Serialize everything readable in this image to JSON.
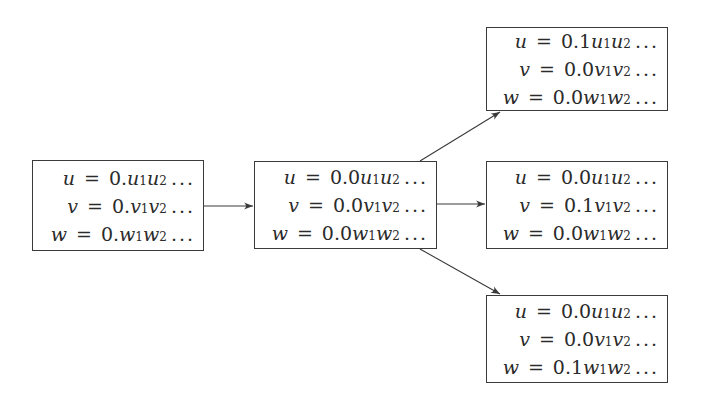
{
  "diagram": {
    "type": "flow-tree",
    "nodes": [
      {
        "id": "root",
        "lines": [
          {
            "lhs": "u",
            "op": "=",
            "prefix": "0.",
            "d1": "u",
            "d2": "u",
            "sub1": "1",
            "sub2": "2",
            "dots": "..."
          },
          {
            "lhs": "v",
            "op": "=",
            "prefix": "0.",
            "d1": "v",
            "d2": "v",
            "sub1": "1",
            "sub2": "2",
            "dots": "..."
          },
          {
            "lhs": "w",
            "op": "=",
            "prefix": "0.",
            "d1": "w",
            "d2": "w",
            "sub1": "1",
            "sub2": "2",
            "dots": "..."
          }
        ]
      },
      {
        "id": "middle",
        "lines": [
          {
            "lhs": "u",
            "op": "=",
            "prefix": "0.0",
            "d1": "u",
            "d2": "u",
            "sub1": "1",
            "sub2": "2",
            "dots": "..."
          },
          {
            "lhs": "v",
            "op": "=",
            "prefix": "0.0",
            "d1": "v",
            "d2": "v",
            "sub1": "1",
            "sub2": "2",
            "dots": "..."
          },
          {
            "lhs": "w",
            "op": "=",
            "prefix": "0.0",
            "d1": "w",
            "d2": "w",
            "sub1": "1",
            "sub2": "2",
            "dots": "..."
          }
        ]
      },
      {
        "id": "child-u",
        "lines": [
          {
            "lhs": "u",
            "op": "=",
            "prefix": "0.1",
            "d1": "u",
            "d2": "u",
            "sub1": "1",
            "sub2": "2",
            "dots": "..."
          },
          {
            "lhs": "v",
            "op": "=",
            "prefix": "0.0",
            "d1": "v",
            "d2": "v",
            "sub1": "1",
            "sub2": "2",
            "dots": "..."
          },
          {
            "lhs": "w",
            "op": "=",
            "prefix": "0.0",
            "d1": "w",
            "d2": "w",
            "sub1": "1",
            "sub2": "2",
            "dots": "..."
          }
        ]
      },
      {
        "id": "child-v",
        "lines": [
          {
            "lhs": "u",
            "op": "=",
            "prefix": "0.0",
            "d1": "u",
            "d2": "u",
            "sub1": "1",
            "sub2": "2",
            "dots": "..."
          },
          {
            "lhs": "v",
            "op": "=",
            "prefix": "0.1",
            "d1": "v",
            "d2": "v",
            "sub1": "1",
            "sub2": "2",
            "dots": "..."
          },
          {
            "lhs": "w",
            "op": "=",
            "prefix": "0.0",
            "d1": "w",
            "d2": "w",
            "sub1": "1",
            "sub2": "2",
            "dots": "..."
          }
        ]
      },
      {
        "id": "child-w",
        "lines": [
          {
            "lhs": "u",
            "op": "=",
            "prefix": "0.0",
            "d1": "u",
            "d2": "u",
            "sub1": "1",
            "sub2": "2",
            "dots": "..."
          },
          {
            "lhs": "v",
            "op": "=",
            "prefix": "0.0",
            "d1": "v",
            "d2": "v",
            "sub1": "1",
            "sub2": "2",
            "dots": "..."
          },
          {
            "lhs": "w",
            "op": "=",
            "prefix": "0.1",
            "d1": "w",
            "d2": "w",
            "sub1": "1",
            "sub2": "2",
            "dots": "..."
          }
        ]
      }
    ],
    "edges": [
      {
        "from": "root",
        "to": "middle"
      },
      {
        "from": "middle",
        "to": "child-u"
      },
      {
        "from": "middle",
        "to": "child-v"
      },
      {
        "from": "middle",
        "to": "child-w"
      }
    ],
    "colors": {
      "background": "#ffffff",
      "stroke": "#3a3a3a",
      "text": "#2a2a2a"
    }
  }
}
